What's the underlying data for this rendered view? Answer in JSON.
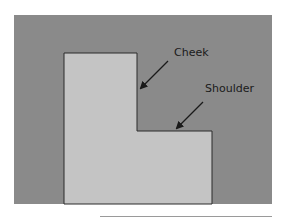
{
  "diagram": {
    "type": "woodworking joint profile (tenon cross-section)",
    "labels": [
      {
        "id": "cheek",
        "text": "Cheek"
      },
      {
        "id": "shoulder",
        "text": "Shoulder"
      }
    ],
    "colors": {
      "background": "#8a8a8a",
      "shape_fill": "#c4c4c4",
      "outline": "#2a2a2a",
      "arrow": "#1a1a1a"
    }
  }
}
